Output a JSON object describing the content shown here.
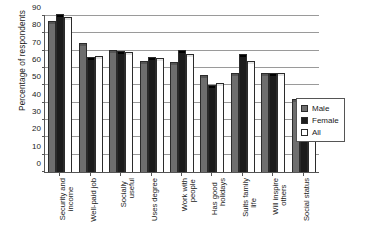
{
  "chart_data": {
    "type": "bar",
    "title": "",
    "xlabel": "",
    "ylabel": "Percentage of respondents",
    "ylim": [
      0,
      90
    ],
    "yticks": [
      0,
      10,
      20,
      30,
      40,
      50,
      60,
      70,
      80,
      90
    ],
    "grid": true,
    "legend_position": "right",
    "categories": [
      "Security and income",
      "Well-paid job",
      "Socially useful",
      "Uses degree",
      "Work with people",
      "Has good holidays",
      "Suits family life",
      "Will inspire others",
      "Social status"
    ],
    "category_lines": [
      [
        "Security and",
        "income"
      ],
      [
        "Well-paid job",
        ""
      ],
      [
        "Socially",
        "useful"
      ],
      [
        "Uses degree",
        ""
      ],
      [
        "Work with",
        "people"
      ],
      [
        "Has good",
        "holidays"
      ],
      [
        "Suits family",
        "life"
      ],
      [
        "Will inspire",
        "others"
      ],
      [
        "Social status",
        ""
      ]
    ],
    "series": [
      {
        "name": "Male",
        "color": "#6e6e6e",
        "values": [
          86,
          73,
          69,
          63,
          62.5,
          55,
          56,
          56,
          41
        ]
      },
      {
        "name": "Female",
        "color": "#1c1c1c",
        "values": [
          90,
          65,
          68.5,
          65,
          69,
          49,
          67,
          56,
          31
        ]
      },
      {
        "name": "All",
        "color": "#ffffff",
        "values": [
          88,
          66,
          68,
          64.5,
          67,
          50,
          63,
          56,
          33
        ]
      }
    ]
  },
  "legend": {
    "items": [
      {
        "label": "Male",
        "swatch": "male-swatch"
      },
      {
        "label": "Female",
        "swatch": "female-swatch"
      },
      {
        "label": "All",
        "swatch": "all-swatch"
      }
    ]
  },
  "caption": {
    "text": ""
  }
}
